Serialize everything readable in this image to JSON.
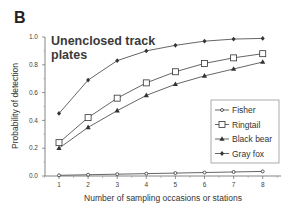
{
  "panel_letter": "B",
  "chart_data": {
    "type": "line",
    "title": "Unenclosed track plates",
    "title_lines": [
      "Unenclosed track",
      "plates"
    ],
    "xlabel": "Number of sampling occasions or stations",
    "ylabel": "Probability of detection",
    "x": [
      1,
      2,
      3,
      4,
      5,
      6,
      7,
      8
    ],
    "xlim": [
      1,
      8
    ],
    "ylim": [
      0,
      1.0
    ],
    "xticks": [
      "1",
      "2",
      "3",
      "4",
      "5",
      "6",
      "7",
      "8"
    ],
    "yticks": [
      0.0,
      0.2,
      0.4,
      0.6,
      0.8,
      1.0
    ],
    "ytick_labels": [
      "0.0",
      "0.2",
      "0.4",
      "0.6",
      "0.8",
      "1.0"
    ],
    "grid": false,
    "legend_position": "right",
    "series": [
      {
        "name": "Fisher",
        "marker": "small-open-circle",
        "values": [
          0.005,
          0.009,
          0.013,
          0.017,
          0.021,
          0.025,
          0.029,
          0.033
        ]
      },
      {
        "name": "Ringtail",
        "marker": "open-square",
        "values": [
          0.24,
          0.42,
          0.56,
          0.67,
          0.75,
          0.81,
          0.85,
          0.88
        ]
      },
      {
        "name": "Black bear",
        "marker": "filled-triangle",
        "values": [
          0.2,
          0.35,
          0.47,
          0.58,
          0.66,
          0.72,
          0.77,
          0.82
        ]
      },
      {
        "name": "Gray fox",
        "marker": "filled-diamond",
        "values": [
          0.45,
          0.69,
          0.83,
          0.9,
          0.94,
          0.97,
          0.985,
          0.99
        ]
      }
    ]
  },
  "colors": {
    "line": "#555555",
    "marker": "#333333",
    "axis": "#666666"
  }
}
